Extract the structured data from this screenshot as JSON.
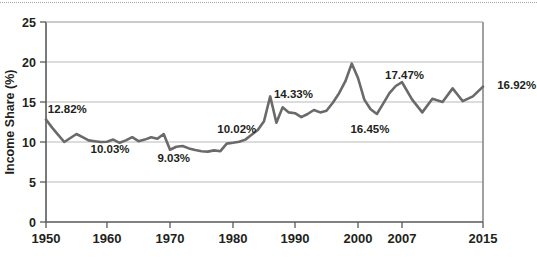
{
  "figure": {
    "name": "income-share-line-chart",
    "top_rule": true,
    "source_note": ""
  },
  "chart_data": {
    "type": "line",
    "title": "",
    "xlabel": "",
    "ylabel": "Income Share (%)",
    "xlim": [
      1950,
      2015
    ],
    "ylim": [
      0,
      25
    ],
    "grid": true,
    "legend": "none",
    "line_color": "#6a6a6a",
    "xticks": [
      1950,
      1960,
      1970,
      1980,
      1990,
      2000,
      2007,
      2015
    ],
    "xtick_labels": [
      "1950",
      "1960",
      "1970",
      "1980",
      "1990",
      "2000",
      "2007",
      "2015"
    ],
    "yticks": [
      0,
      5,
      10,
      15,
      20,
      25
    ],
    "ytick_labels": [
      "0",
      "5",
      "10",
      "15",
      "20",
      "25"
    ],
    "x": [
      1950,
      1951,
      1952,
      1953,
      1954,
      1955,
      1956,
      1957,
      1958,
      1959,
      1960,
      1961,
      1962,
      1963,
      1964,
      1965,
      1966,
      1967,
      1968,
      1969,
      1970,
      1971,
      1972,
      1973,
      1974,
      1975,
      1976,
      1977,
      1978,
      1979,
      1980,
      1981,
      1982,
      1983,
      1984,
      1985,
      1986,
      1987,
      1988,
      1989,
      1990,
      1991,
      1992,
      1993,
      1994,
      1995,
      1996,
      1997,
      1998,
      1999,
      2000,
      2001,
      2002,
      2003,
      2004,
      2005,
      2006,
      2007,
      2008,
      2009,
      2010,
      2011,
      2012,
      2013,
      2014,
      2015
    ],
    "values": [
      12.82,
      11.8,
      10.9,
      10.0,
      10.5,
      11.0,
      10.6,
      10.2,
      10.1,
      10.0,
      10.03,
      10.3,
      9.9,
      10.2,
      10.6,
      10.1,
      10.3,
      10.6,
      10.4,
      11.0,
      9.03,
      9.4,
      9.5,
      9.2,
      9.0,
      8.85,
      8.8,
      8.95,
      8.85,
      9.8,
      9.9,
      10.02,
      10.3,
      10.9,
      11.5,
      12.6,
      15.7,
      12.4,
      14.33,
      13.7,
      13.6,
      13.1,
      13.5,
      14.0,
      13.7,
      13.9,
      14.9,
      16.1,
      17.6,
      19.8,
      18.0,
      15.3,
      14.1,
      13.5,
      14.8,
      16.1,
      17.0,
      17.47,
      15.3,
      13.7,
      15.4,
      15.0,
      16.7,
      15.1,
      15.7,
      16.92
    ],
    "annotations": [
      {
        "label": "12.82%",
        "x": 1950,
        "value": 12.82,
        "text_x": 1950.3,
        "text_y": 13.6
      },
      {
        "label": "10.03%",
        "x": 1960,
        "value": 10.03,
        "text_x": 1957.3,
        "text_y": 8.6
      },
      {
        "label": "9.03%",
        "x": 1970,
        "value": 9.03,
        "text_x": 1968.0,
        "text_y": 7.45
      },
      {
        "label": "10.02%",
        "x": 1981,
        "value": 10.02,
        "text_x": 1977.5,
        "text_y": 11.1
      },
      {
        "label": "14.33%",
        "x": 1988,
        "value": 14.33,
        "text_x": 1986.6,
        "text_y": 15.45
      },
      {
        "label": "16.45%",
        "x": 2003,
        "value": 16.45,
        "text_x": 1998.8,
        "text_y": 11.15
      },
      {
        "label": "17.47%",
        "x": 2007,
        "value": 17.47,
        "text_x": 2004.3,
        "text_y": 17.9
      },
      {
        "label": "16.92%",
        "x": 2015,
        "value": 16.92,
        "text_x": 2016.4,
        "text_y": 16.6
      }
    ]
  }
}
